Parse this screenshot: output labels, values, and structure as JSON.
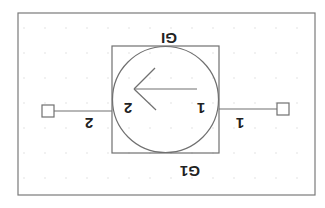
{
  "symbol": {
    "type": "circulator-style two-port component",
    "orientation_deg": 180,
    "inst_label_top": "GI",
    "inst_label_bottom": "G1",
    "pin_left_inner": "2",
    "pin_right_inner": "1",
    "pin_left_outer": "2",
    "pin_right_outer": "1"
  },
  "colors": {
    "background": "#ffffff",
    "frame": "#7a7a7a",
    "stroke": "#707070",
    "grid_dot": "#d8d8d8",
    "text": "#222222"
  }
}
